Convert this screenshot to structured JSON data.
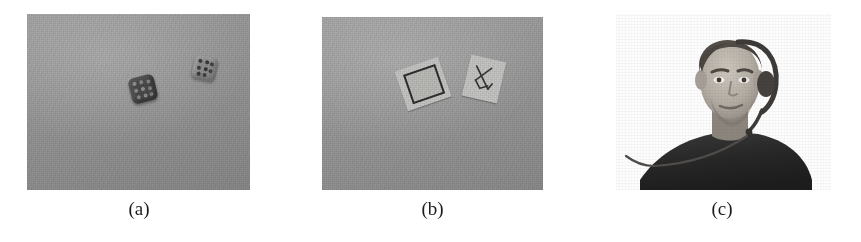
{
  "figure": {
    "page_background": "#ffffff",
    "caption_color": "#1c1c1c",
    "panels": [
      {
        "id": "a",
        "caption": "(a)",
        "kind": "photograph",
        "subject": "two dice on a gray table surface",
        "background_color": "#9a9a9a",
        "bounds": {
          "x": 27,
          "y": 14,
          "width": 223,
          "height": 176
        },
        "caption_center_x": 139,
        "objects": [
          {
            "name": "dark-die",
            "color": "#474747",
            "pip_color": "#8c8c8c",
            "x": 103,
            "y": 62,
            "size": 26,
            "rotation": -14
          },
          {
            "name": "light-die",
            "color": "#8e8e8e",
            "pip_color": "#3a3a3a",
            "x": 166,
            "y": 42,
            "size": 24,
            "rotation": 12
          }
        ]
      },
      {
        "id": "b",
        "caption": "(b)",
        "kind": "photograph",
        "subject": "two paper fiducial markers on a gray table surface",
        "background_color": "#9d9d9d",
        "bounds": {
          "x": 322,
          "y": 17,
          "width": 221,
          "height": 173
        },
        "caption_center_x": 432,
        "objects": [
          {
            "name": "square-frame-marker",
            "card_color": "#c9c9c7",
            "ink_color": "#2f2f2f",
            "x": 400,
            "y": 63,
            "width": 44,
            "height": 40,
            "rotation": -19
          },
          {
            "name": "sketch-marker",
            "card_color": "#c9c9c7",
            "ink_color": "#3a3a3a",
            "x": 466,
            "y": 58,
            "width": 34,
            "height": 40,
            "rotation": 13
          }
        ]
      },
      {
        "id": "c",
        "caption": "(c)",
        "kind": "photograph",
        "subject": "person wearing a headset, white background",
        "background_color": "#fdfdfd",
        "bounds": {
          "x": 616,
          "y": 14,
          "width": 215,
          "height": 176
        },
        "caption_center_x": 722,
        "objects": [
          {
            "name": "head",
            "skin_color": "#b9b2aa",
            "hair_color": "#4a443f",
            "x": 699,
            "y": 30,
            "width": 58,
            "height": 80
          },
          {
            "name": "torso",
            "shirt_color": "#2b2b2b",
            "x": 640,
            "y": 118,
            "width": 172,
            "height": 72
          },
          {
            "name": "headset",
            "color": "#3d3a38",
            "cable_color": "#5a5754"
          }
        ]
      }
    ]
  }
}
